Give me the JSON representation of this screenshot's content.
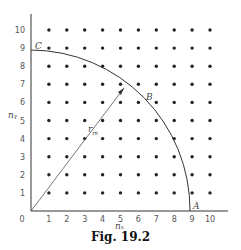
{
  "figure": {
    "caption": "Fig. 19.2",
    "x_axis_label": "nₓ",
    "y_axis_label": "nᵧ",
    "x_ticks": [
      "0",
      "1",
      "2",
      "3",
      "4",
      "5",
      "6",
      "7",
      "8",
      "9",
      "10"
    ],
    "y_ticks": [
      "1",
      "2",
      "3",
      "4",
      "5",
      "6",
      "7",
      "8",
      "9",
      "10"
    ],
    "points": {
      "A": "A",
      "B": "B",
      "C": "C"
    },
    "radius_label": "r",
    "radius_subscript": "m",
    "grid": {
      "nx": 10,
      "ny": 10
    },
    "arc_radius_units": 8.9
  }
}
